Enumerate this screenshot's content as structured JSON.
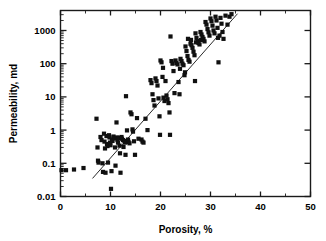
{
  "chart_data": {
    "type": "scatter",
    "title": "",
    "xlabel": "Porosity, %",
    "ylabel": "Permeability, md",
    "xlim": [
      0,
      50
    ],
    "ylim": [
      0.01,
      4000
    ],
    "yscale": "log",
    "xscale": "linear",
    "grid": false,
    "legend": null,
    "xticks": [
      0,
      10,
      20,
      30,
      40,
      50
    ],
    "xtick_labels": [
      "0",
      "10",
      "20",
      "30",
      "40",
      "50"
    ],
    "yticks": [
      0.01,
      0.1,
      1,
      10,
      100,
      1000
    ],
    "ytick_labels": [
      "0.01",
      "0.1",
      "1",
      "10",
      "100",
      "1000"
    ],
    "marker": "square",
    "marker_color": "#101010",
    "marker_size": 4.2,
    "trendline": {
      "type": "log-linear-fit",
      "x_start": 6.4,
      "y_start": 0.035,
      "x_end": 35.4,
      "y_end": 3200
    },
    "points": [
      [
        0.2,
        0.062
      ],
      [
        1.1,
        0.062
      ],
      [
        2.7,
        0.065
      ],
      [
        4.6,
        0.072
      ],
      [
        7.2,
        2.2
      ],
      [
        7.4,
        0.3
      ],
      [
        7.5,
        0.12
      ],
      [
        7.6,
        0.105
      ],
      [
        8.0,
        0.62
      ],
      [
        8.2,
        0.5
      ],
      [
        8.4,
        0.1
      ],
      [
        8.5,
        0.055
      ],
      [
        8.7,
        0.78
      ],
      [
        8.8,
        0.45
      ],
      [
        8.9,
        0.28
      ],
      [
        9.0,
        0.052
      ],
      [
        9.2,
        0.66
      ],
      [
        9.3,
        0.38
      ],
      [
        9.4,
        0.33
      ],
      [
        9.5,
        0.105
      ],
      [
        9.7,
        0.7
      ],
      [
        9.8,
        0.6
      ],
      [
        9.9,
        0.42
      ],
      [
        10.0,
        0.35
      ],
      [
        10.1,
        0.017
      ],
      [
        10.2,
        0.058
      ],
      [
        10.3,
        0.52
      ],
      [
        10.4,
        0.47
      ],
      [
        10.6,
        0.64
      ],
      [
        10.8,
        0.56
      ],
      [
        10.9,
        0.3
      ],
      [
        11.0,
        0.085
      ],
      [
        11.2,
        1.7
      ],
      [
        11.3,
        0.6
      ],
      [
        11.4,
        0.5
      ],
      [
        11.5,
        0.42
      ],
      [
        11.7,
        0.58
      ],
      [
        11.8,
        0.34
      ],
      [
        11.9,
        0.2
      ],
      [
        12.0,
        0.052
      ],
      [
        12.2,
        0.62
      ],
      [
        12.3,
        0.55
      ],
      [
        12.5,
        0.5
      ],
      [
        12.6,
        0.31
      ],
      [
        12.8,
        0.47
      ],
      [
        12.9,
        0.42
      ],
      [
        13.0,
        0.18
      ],
      [
        13.1,
        10.5
      ],
      [
        13.3,
        0.98
      ],
      [
        13.5,
        0.52
      ],
      [
        13.6,
        0.44
      ],
      [
        13.8,
        0.4
      ],
      [
        14.0,
        3.4
      ],
      [
        14.2,
        3.0
      ],
      [
        14.4,
        1.05
      ],
      [
        14.5,
        0.9
      ],
      [
        14.7,
        0.46
      ],
      [
        14.9,
        0.18
      ],
      [
        15.3,
        2.3
      ],
      [
        15.6,
        0.55
      ],
      [
        16.2,
        0.52
      ],
      [
        16.4,
        0.45
      ],
      [
        16.6,
        0.42
      ],
      [
        17.0,
        2.2
      ],
      [
        17.4,
        1.0
      ],
      [
        18.0,
        32
      ],
      [
        18.2,
        26
      ],
      [
        18.4,
        12
      ],
      [
        18.6,
        8.0
      ],
      [
        18.8,
        5.5
      ],
      [
        19.0,
        36
      ],
      [
        19.2,
        30
      ],
      [
        19.4,
        22
      ],
      [
        19.6,
        9.0
      ],
      [
        19.8,
        2.6
      ],
      [
        19.9,
        0.72
      ],
      [
        20.0,
        125
      ],
      [
        20.2,
        110
      ],
      [
        20.4,
        40
      ],
      [
        20.6,
        9.5
      ],
      [
        20.8,
        7.5
      ],
      [
        21.0,
        30
      ],
      [
        21.2,
        11
      ],
      [
        21.4,
        8.5
      ],
      [
        21.6,
        6.5
      ],
      [
        21.8,
        3.4
      ],
      [
        21.9,
        0.72
      ],
      [
        22.0,
        660
      ],
      [
        22.2,
        120
      ],
      [
        22.4,
        100
      ],
      [
        22.6,
        60
      ],
      [
        22.8,
        13
      ],
      [
        23.0,
        125
      ],
      [
        23.2,
        105
      ],
      [
        23.4,
        95
      ],
      [
        23.6,
        28
      ],
      [
        23.8,
        12
      ],
      [
        24.0,
        140
      ],
      [
        24.2,
        120
      ],
      [
        24.4,
        100
      ],
      [
        24.6,
        90
      ],
      [
        24.8,
        45
      ],
      [
        25.0,
        330
      ],
      [
        25.2,
        240
      ],
      [
        25.4,
        170
      ],
      [
        25.6,
        130
      ],
      [
        25.8,
        115
      ],
      [
        26.0,
        400
      ],
      [
        26.2,
        360
      ],
      [
        26.4,
        300
      ],
      [
        26.6,
        230
      ],
      [
        26.8,
        180
      ],
      [
        26.9,
        30
      ],
      [
        27.0,
        820
      ],
      [
        27.2,
        600
      ],
      [
        27.4,
        480
      ],
      [
        27.6,
        420
      ],
      [
        27.8,
        380
      ],
      [
        28.0,
        900
      ],
      [
        28.2,
        760
      ],
      [
        28.4,
        640
      ],
      [
        28.6,
        560
      ],
      [
        28.8,
        470
      ],
      [
        29.0,
        1800
      ],
      [
        29.2,
        1500
      ],
      [
        29.4,
        1100
      ],
      [
        29.6,
        880
      ],
      [
        29.8,
        700
      ],
      [
        30.0,
        2300
      ],
      [
        30.2,
        1900
      ],
      [
        30.4,
        1400
      ],
      [
        30.6,
        1000
      ],
      [
        30.8,
        820
      ],
      [
        31.0,
        2600
      ],
      [
        31.2,
        2000
      ],
      [
        31.4,
        1200
      ],
      [
        31.5,
        600
      ],
      [
        31.6,
        110
      ],
      [
        31.8,
        700
      ],
      [
        32.0,
        2400
      ],
      [
        32.2,
        1600
      ],
      [
        32.4,
        900
      ],
      [
        32.6,
        560
      ],
      [
        33.0,
        2800
      ],
      [
        33.4,
        1500
      ],
      [
        33.8,
        2600
      ],
      [
        34.2,
        3100
      ],
      [
        25.5,
        560
      ],
      [
        26.1,
        520
      ],
      [
        27.1,
        440
      ],
      [
        28.1,
        520
      ],
      [
        23.9,
        70
      ],
      [
        24.9,
        55
      ],
      [
        20.5,
        75
      ]
    ]
  }
}
